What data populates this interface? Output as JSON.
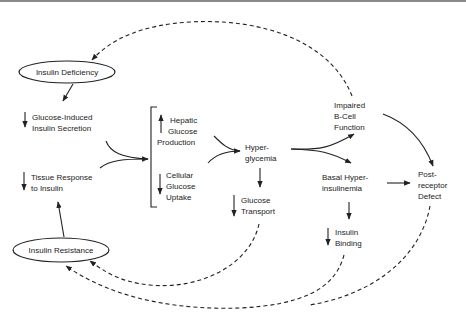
{
  "diagram": {
    "type": "pathophysiology-flow",
    "nodes": {
      "insulin_deficiency": {
        "label": "Insulin Deficiency",
        "shape": "ellipse"
      },
      "insulin_resistance": {
        "label": "Insulin Resistance",
        "shape": "ellipse"
      },
      "glucose_induced": {
        "line1": "Glucose-Induced",
        "line2": "Insulin Secretion",
        "indicator": "down"
      },
      "tissue_response": {
        "line1": "Tissue Response",
        "line2": "to Insulin",
        "indicator": "down"
      },
      "hepatic": {
        "line1": "Hepatic",
        "line2": "Glucose",
        "line3": "Production",
        "indicator": "up"
      },
      "cellular": {
        "line1": "Cellular",
        "line2": "Glucose",
        "line3": "Uptake",
        "indicator": "down"
      },
      "hyperglycemia": {
        "line1": "Hyper-",
        "line2": "glycemia"
      },
      "glucose_transport": {
        "line1": "Glucose",
        "line2": "Transport",
        "indicator": "down"
      },
      "impaired_bcell": {
        "line1": "Impaired",
        "line2": "B-Cell",
        "line3": "Function"
      },
      "basal_hyper": {
        "line1": "Basal Hyper-",
        "line2": "insulinemia"
      },
      "insulin_binding": {
        "line1": "Insulin",
        "line2": "Binding",
        "indicator": "down"
      },
      "post_receptor": {
        "line1": "Post-",
        "line2": "receptor",
        "line3": "Defect"
      }
    },
    "edges": [
      {
        "from": "insulin_deficiency",
        "to": "glucose_induced",
        "style": "solid"
      },
      {
        "from": "insulin_resistance",
        "to": "tissue_response",
        "style": "solid"
      },
      {
        "from": "glucose_induced+tissue_response",
        "to": "hepatic+cellular",
        "style": "solid"
      },
      {
        "from": "hepatic+cellular",
        "to": "hyperglycemia",
        "style": "solid"
      },
      {
        "from": "hyperglycemia",
        "to": "glucose_transport",
        "style": "solid"
      },
      {
        "from": "hyperglycemia",
        "to": "impaired_bcell",
        "style": "solid"
      },
      {
        "from": "hyperglycemia",
        "to": "basal_hyper",
        "style": "solid"
      },
      {
        "from": "impaired_bcell",
        "to": "post_receptor",
        "style": "solid"
      },
      {
        "from": "basal_hyper",
        "to": "post_receptor",
        "style": "solid"
      },
      {
        "from": "basal_hyper",
        "to": "insulin_binding",
        "style": "solid"
      },
      {
        "from": "impaired_bcell",
        "to": "insulin_deficiency",
        "style": "dashed"
      },
      {
        "from": "glucose_transport",
        "to": "insulin_resistance",
        "style": "dashed"
      },
      {
        "from": "insulin_binding",
        "to": "insulin_resistance",
        "style": "dashed"
      },
      {
        "from": "post_receptor",
        "to": "insulin_resistance",
        "style": "dashed"
      }
    ],
    "colors": {
      "ink": "#222222",
      "background": "#ffffff",
      "top_border": "#8a8a8a"
    }
  }
}
